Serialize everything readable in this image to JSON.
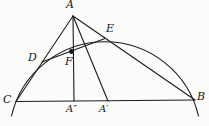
{
  "figure": {
    "type": "geometry-diagram",
    "background_color": "#fbfbf9",
    "stroke_color": "#1c1c1c",
    "labels": {
      "A": "A",
      "B": "B",
      "C": "C",
      "D": "D",
      "E": "E",
      "F": "F",
      "A_double_prime": "A″",
      "A_prime": "A′"
    },
    "marked_point": {
      "at": "F",
      "style": "filled-dot",
      "color": "#111111"
    },
    "elements": {
      "baseline": "C to B",
      "sides": [
        "A to C through D",
        "A to B through E"
      ],
      "cevians": [
        "A to A″",
        "A to A′"
      ],
      "chord": "D to E through F",
      "arc": "circular arc through C, D, E, B"
    }
  }
}
